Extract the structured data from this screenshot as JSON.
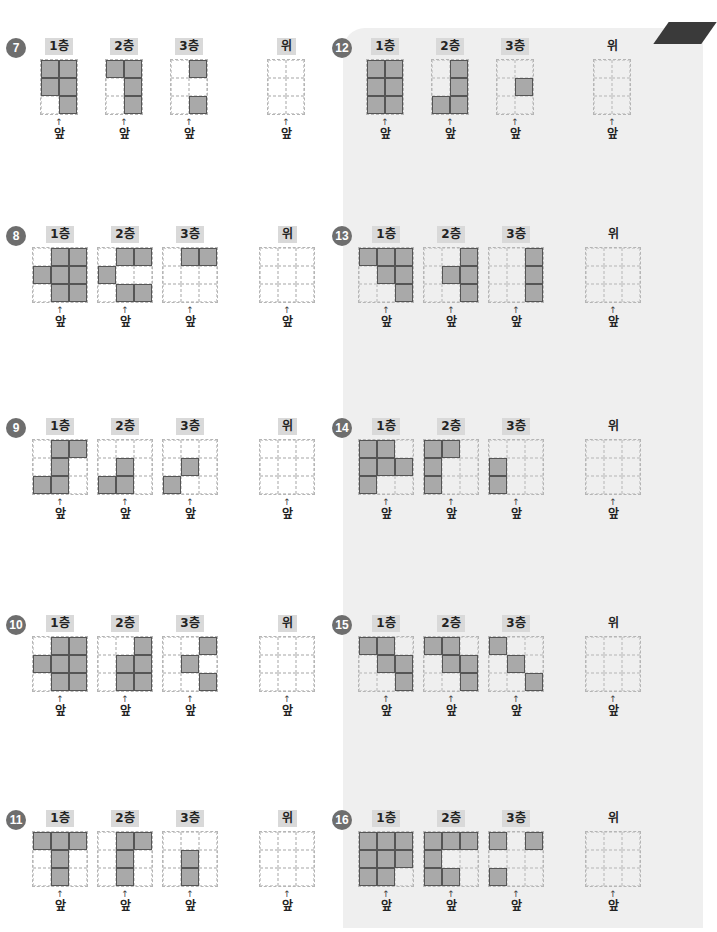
{
  "labels": {
    "floor1": "1층",
    "floor2": "2층",
    "floor3": "3층",
    "top": "위",
    "front": "앞",
    "arrow": "↑"
  },
  "problems": [
    {
      "number": "7",
      "cols": 2,
      "rows": 3,
      "floors": [
        [
          [
            1,
            1
          ],
          [
            1,
            1
          ],
          [
            0,
            1
          ]
        ],
        [
          [
            1,
            1
          ],
          [
            0,
            1
          ],
          [
            0,
            1
          ]
        ],
        [
          [
            0,
            1
          ],
          [
            0,
            0
          ],
          [
            0,
            1
          ]
        ]
      ]
    },
    {
      "number": "8",
      "cols": 3,
      "rows": 3,
      "floors": [
        [
          [
            0,
            1,
            1
          ],
          [
            1,
            1,
            1
          ],
          [
            0,
            1,
            1
          ]
        ],
        [
          [
            0,
            1,
            1
          ],
          [
            1,
            0,
            0
          ],
          [
            0,
            1,
            1
          ]
        ],
        [
          [
            0,
            1,
            1
          ],
          [
            0,
            0,
            0
          ],
          [
            0,
            0,
            0
          ]
        ]
      ]
    },
    {
      "number": "9",
      "cols": 3,
      "rows": 3,
      "floors": [
        [
          [
            0,
            1,
            1
          ],
          [
            0,
            1,
            0
          ],
          [
            1,
            1,
            0
          ]
        ],
        [
          [
            0,
            0,
            0
          ],
          [
            0,
            1,
            0
          ],
          [
            1,
            1,
            0
          ]
        ],
        [
          [
            0,
            0,
            0
          ],
          [
            0,
            1,
            0
          ],
          [
            1,
            0,
            0
          ]
        ]
      ]
    },
    {
      "number": "10",
      "cols": 3,
      "rows": 3,
      "floors": [
        [
          [
            0,
            1,
            1
          ],
          [
            1,
            1,
            1
          ],
          [
            0,
            1,
            1
          ]
        ],
        [
          [
            0,
            0,
            1
          ],
          [
            0,
            1,
            1
          ],
          [
            0,
            1,
            1
          ]
        ],
        [
          [
            0,
            0,
            1
          ],
          [
            0,
            1,
            0
          ],
          [
            0,
            0,
            1
          ]
        ]
      ]
    },
    {
      "number": "11",
      "cols": 3,
      "rows": 3,
      "floors": [
        [
          [
            1,
            1,
            1
          ],
          [
            0,
            1,
            0
          ],
          [
            0,
            1,
            0
          ]
        ],
        [
          [
            0,
            1,
            1
          ],
          [
            0,
            1,
            0
          ],
          [
            0,
            1,
            0
          ]
        ],
        [
          [
            0,
            0,
            0
          ],
          [
            0,
            1,
            0
          ],
          [
            0,
            1,
            0
          ]
        ]
      ]
    },
    {
      "number": "12",
      "cols": 2,
      "rows": 3,
      "floors": [
        [
          [
            1,
            1
          ],
          [
            1,
            1
          ],
          [
            1,
            1
          ]
        ],
        [
          [
            0,
            1
          ],
          [
            0,
            1
          ],
          [
            1,
            1
          ]
        ],
        [
          [
            0,
            0
          ],
          [
            0,
            1
          ],
          [
            0,
            0
          ]
        ]
      ]
    },
    {
      "number": "13",
      "cols": 3,
      "rows": 3,
      "floors": [
        [
          [
            1,
            1,
            1
          ],
          [
            0,
            1,
            1
          ],
          [
            0,
            0,
            1
          ]
        ],
        [
          [
            0,
            0,
            1
          ],
          [
            0,
            1,
            1
          ],
          [
            0,
            0,
            1
          ]
        ],
        [
          [
            0,
            0,
            1
          ],
          [
            0,
            0,
            1
          ],
          [
            0,
            0,
            1
          ]
        ]
      ]
    },
    {
      "number": "14",
      "cols": 3,
      "rows": 3,
      "floors": [
        [
          [
            1,
            1,
            0
          ],
          [
            1,
            1,
            1
          ],
          [
            1,
            0,
            0
          ]
        ],
        [
          [
            1,
            1,
            0
          ],
          [
            1,
            0,
            0
          ],
          [
            1,
            0,
            0
          ]
        ],
        [
          [
            0,
            0,
            0
          ],
          [
            1,
            0,
            0
          ],
          [
            1,
            0,
            0
          ]
        ]
      ]
    },
    {
      "number": "15",
      "cols": 3,
      "rows": 3,
      "floors": [
        [
          [
            1,
            1,
            0
          ],
          [
            0,
            1,
            1
          ],
          [
            0,
            0,
            1
          ]
        ],
        [
          [
            1,
            1,
            0
          ],
          [
            0,
            1,
            1
          ],
          [
            0,
            0,
            1
          ]
        ],
        [
          [
            1,
            0,
            0
          ],
          [
            0,
            1,
            0
          ],
          [
            0,
            0,
            1
          ]
        ]
      ]
    },
    {
      "number": "16",
      "cols": 3,
      "rows": 3,
      "floors": [
        [
          [
            1,
            1,
            1
          ],
          [
            1,
            1,
            1
          ],
          [
            1,
            1,
            0
          ]
        ],
        [
          [
            1,
            1,
            1
          ],
          [
            1,
            0,
            0
          ],
          [
            1,
            1,
            0
          ]
        ],
        [
          [
            1,
            0,
            1
          ],
          [
            0,
            0,
            0
          ],
          [
            1,
            0,
            0
          ]
        ]
      ]
    }
  ]
}
